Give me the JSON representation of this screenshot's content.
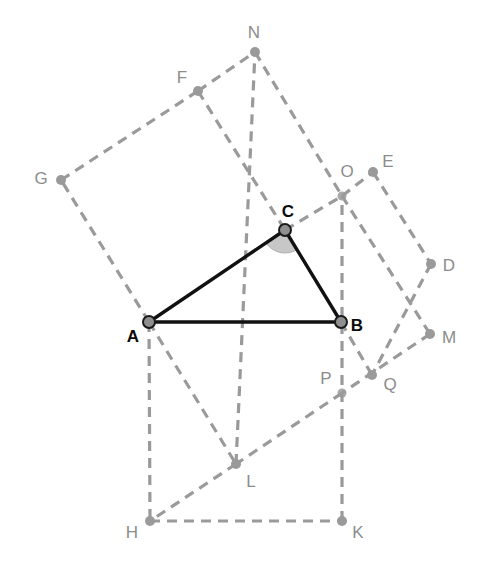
{
  "figure": {
    "width": 487,
    "height": 570,
    "background_color": "#ffffff"
  },
  "style": {
    "triangle_stroke_color": "#111111",
    "triangle_stroke_width": 3.4,
    "construction_stroke_color": "#9a9a9a",
    "construction_stroke_width": 3.2,
    "construction_dash": "10,7",
    "angle_sector_fill": "#c7c7c7",
    "angle_sector_stroke": "#b0b0b0",
    "vertex_dot_fill_main": "#8f8f8f",
    "vertex_dot_stroke_main": "#1a1a1a",
    "vertex_dot_fill_aux": "#9a9a9a",
    "label_color_main": "#0b0b0b",
    "label_color_aux": "#8c8c8c"
  },
  "points": [
    {
      "id": "A",
      "label": "A",
      "x": 149,
      "y": 322,
      "label_x": 133,
      "label_y": 337,
      "kind": "triangle-vertex",
      "emphasis": "strong",
      "dot": "main",
      "radius": 6
    },
    {
      "id": "B",
      "label": "B",
      "x": 341,
      "y": 322,
      "label_x": 357,
      "label_y": 326,
      "kind": "triangle-vertex",
      "emphasis": "strong",
      "dot": "main",
      "radius": 6
    },
    {
      "id": "C",
      "label": "C",
      "x": 285,
      "y": 230,
      "label_x": 288,
      "label_y": 212,
      "kind": "triangle-vertex",
      "emphasis": "strong",
      "dot": "main",
      "radius": 6
    },
    {
      "id": "D",
      "label": "D",
      "x": 431,
      "y": 264,
      "label_x": 449,
      "label_y": 266,
      "kind": "square-vertex",
      "emphasis": "faint",
      "dot": "aux",
      "radius": 5
    },
    {
      "id": "E",
      "label": "E",
      "x": 373,
      "y": 172,
      "label_x": 388,
      "label_y": 162,
      "kind": "square-vertex",
      "emphasis": "faint",
      "dot": "aux",
      "radius": 5
    },
    {
      "id": "F",
      "label": "F",
      "x": 198,
      "y": 91,
      "label_x": 182,
      "label_y": 78,
      "kind": "square-vertex",
      "emphasis": "faint",
      "dot": "aux",
      "radius": 5
    },
    {
      "id": "G",
      "label": "G",
      "x": 61,
      "y": 180,
      "label_x": 41,
      "label_y": 179,
      "kind": "square-vertex",
      "emphasis": "faint",
      "dot": "aux",
      "radius": 5
    },
    {
      "id": "H",
      "label": "H",
      "x": 150,
      "y": 521,
      "label_x": 132,
      "label_y": 533,
      "kind": "square-vertex",
      "emphasis": "faint",
      "dot": "aux",
      "radius": 5
    },
    {
      "id": "K",
      "label": "K",
      "x": 342,
      "y": 521,
      "label_x": 358,
      "label_y": 533,
      "kind": "square-vertex",
      "emphasis": "faint",
      "dot": "aux",
      "radius": 5
    },
    {
      "id": "L",
      "label": "L",
      "x": 236,
      "y": 464,
      "label_x": 251,
      "label_y": 482,
      "kind": "intersection",
      "emphasis": "faint",
      "dot": "aux",
      "radius": 5
    },
    {
      "id": "M",
      "label": "M",
      "x": 430,
      "y": 334,
      "label_x": 449,
      "label_y": 338,
      "kind": "square-vertex",
      "emphasis": "faint",
      "dot": "aux",
      "radius": 5
    },
    {
      "id": "N",
      "label": "N",
      "x": 255,
      "y": 52,
      "label_x": 254,
      "label_y": 33,
      "kind": "square-vertex",
      "emphasis": "faint",
      "dot": "aux",
      "radius": 5
    },
    {
      "id": "O",
      "label": "O",
      "x": 342,
      "y": 196,
      "label_x": 347,
      "label_y": 172,
      "kind": "intersection",
      "emphasis": "faint",
      "dot": "cross",
      "radius": 5
    },
    {
      "id": "P",
      "label": "P",
      "x": 342,
      "y": 393,
      "label_x": 326,
      "label_y": 379,
      "kind": "intersection",
      "emphasis": "faint",
      "dot": "cross",
      "radius": 5
    },
    {
      "id": "Q",
      "label": "Q",
      "x": 372,
      "y": 375,
      "label_x": 390,
      "label_y": 385,
      "kind": "square-vertex",
      "emphasis": "faint",
      "dot": "aux",
      "radius": 5
    }
  ],
  "triangle": {
    "name": "ABC",
    "vertices": [
      "A",
      "B",
      "C"
    ],
    "edges": [
      {
        "id": "AB",
        "from": "A",
        "to": "B"
      },
      {
        "id": "BC",
        "from": "B",
        "to": "C"
      },
      {
        "id": "CA",
        "from": "C",
        "to": "A"
      }
    ]
  },
  "angle_marker": {
    "at": "C",
    "from": "A",
    "to": "B",
    "radius": 23,
    "shaded": true
  },
  "construction_segments": [
    {
      "id": "A-G",
      "from": "A",
      "to": "G"
    },
    {
      "id": "G-F",
      "from": "G",
      "to": "F"
    },
    {
      "id": "F-C",
      "from": "F",
      "to": "C"
    },
    {
      "id": "F-N",
      "from": "F",
      "to": "N"
    },
    {
      "id": "N-O",
      "from": "N",
      "to": "O"
    },
    {
      "id": "C-O",
      "from": "C",
      "to": "O"
    },
    {
      "id": "O-E",
      "from": "O",
      "to": "E"
    },
    {
      "id": "E-D",
      "from": "E",
      "to": "D"
    },
    {
      "id": "D-Q",
      "from": "D",
      "to": "Q"
    },
    {
      "id": "B-Q",
      "from": "B",
      "to": "Q"
    },
    {
      "id": "O-M",
      "from": "O",
      "to": "M"
    },
    {
      "id": "M-P",
      "from": "M",
      "to": "P"
    },
    {
      "id": "P-L",
      "from": "P",
      "to": "L"
    },
    {
      "id": "L-H",
      "from": "L",
      "to": "H"
    },
    {
      "id": "A-H",
      "from": "A",
      "to": "H"
    },
    {
      "id": "H-K",
      "from": "H",
      "to": "K"
    },
    {
      "id": "K-B-O",
      "from": "K",
      "to": "O"
    },
    {
      "id": "A-L",
      "from": "A",
      "to": "L"
    },
    {
      "id": "L-C-N",
      "from": "L",
      "to": "N"
    }
  ]
}
